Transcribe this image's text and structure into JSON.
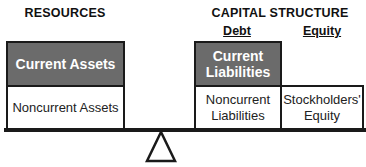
{
  "headings": {
    "resources": "RESOURCES",
    "capital_structure": "CAPITAL STRUCTURE",
    "debt": "Debt",
    "equity": "Equity"
  },
  "resources": {
    "current_assets": "Current Assets",
    "noncurrent_assets": "Noncurrent Assets"
  },
  "capital": {
    "current_liabilities_line1": "Current",
    "current_liabilities_line2": "Liabilities",
    "noncurrent_liabilities_line1": "Noncurrent",
    "noncurrent_liabilities_line2": "Liabilities",
    "stockholders_equity_line1": "Stockholders'",
    "stockholders_equity_line2": "Equity"
  },
  "colors": {
    "dark_box": "#6b6b6b",
    "border": "#1a1a1a"
  }
}
